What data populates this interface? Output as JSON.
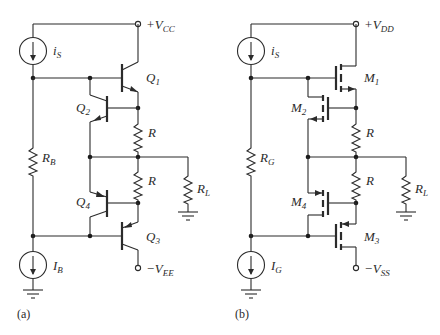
{
  "figure": {
    "panels": [
      {
        "id": "a",
        "caption": "(a)",
        "supply_pos": {
          "sign": "+",
          "main": "V",
          "sub": "CC"
        },
        "supply_neg": {
          "sign": "−",
          "main": "V",
          "sub": "EE"
        },
        "source_top": {
          "main": "i",
          "sub": "S"
        },
        "source_bottom": {
          "main": "I",
          "sub": "B"
        },
        "bias_resistor": {
          "main": "R",
          "sub": "B"
        },
        "load_resistor": {
          "main": "R",
          "sub": "L"
        },
        "resistor_upper": "R",
        "resistor_lower": "R",
        "devices": [
          {
            "main": "Q",
            "sub": "1",
            "type": "npn"
          },
          {
            "main": "Q",
            "sub": "2",
            "type": "pnp"
          },
          {
            "main": "Q",
            "sub": "4",
            "type": "npn"
          },
          {
            "main": "Q",
            "sub": "3",
            "type": "pnp"
          }
        ]
      },
      {
        "id": "b",
        "caption": "(b)",
        "supply_pos": {
          "sign": "+",
          "main": "V",
          "sub": "DD"
        },
        "supply_neg": {
          "sign": "−",
          "main": "V",
          "sub": "SS"
        },
        "source_top": {
          "main": "i",
          "sub": "S"
        },
        "source_bottom": {
          "main": "I",
          "sub": "G"
        },
        "bias_resistor": {
          "main": "R",
          "sub": "G"
        },
        "load_resistor": {
          "main": "R",
          "sub": "L"
        },
        "resistor_upper": "R",
        "resistor_lower": "R",
        "devices": [
          {
            "main": "M",
            "sub": "1",
            "type": "nmos"
          },
          {
            "main": "M",
            "sub": "2",
            "type": "pmos"
          },
          {
            "main": "M",
            "sub": "4",
            "type": "nmos"
          },
          {
            "main": "M",
            "sub": "3",
            "type": "pmos"
          }
        ]
      }
    ]
  }
}
